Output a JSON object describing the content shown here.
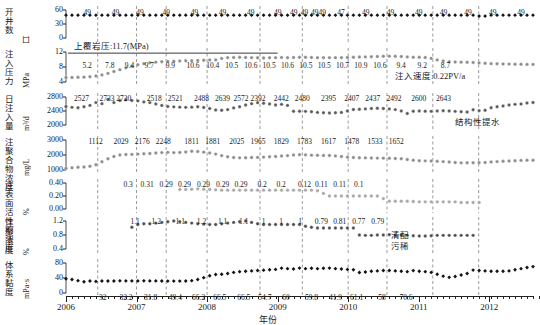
{
  "chart_data": {
    "type": "line",
    "title": "",
    "xlabel": "年份",
    "grid": "vertical dashed separators at year boundaries",
    "legend": "none",
    "x_range": [
      "2006",
      "2012.6"
    ],
    "x_ticks": [
      "2006",
      "2007",
      "2008",
      "2009",
      "2010",
      "2011",
      "2012"
    ],
    "annotations": [
      {
        "text": "上覆岩压:11.7(MPa)",
        "panel": "injection_pressure"
      },
      {
        "text": "注入速度:0.22PV/a",
        "panel": "injection_pressure"
      },
      {
        "text": "结构性提水",
        "panel": "daily_injection"
      },
      {
        "text": "清配",
        "panel": "polymer_concentration"
      },
      {
        "text": "污稀",
        "panel": "polymer_concentration"
      }
    ],
    "panels": [
      {
        "id": "open_wells",
        "ylabel": "开井数",
        "yunit": "口",
        "ylim": [
          0,
          60
        ],
        "yticks": [
          "0",
          "30",
          "60"
        ],
        "marker": "filled-diamond-black",
        "color": "#141414",
        "data_labels": [
          "49",
          "49",
          "49",
          "49",
          "49",
          "49",
          "49",
          "49",
          "49",
          "49",
          "4949",
          "47",
          "49",
          "49",
          "49",
          "49",
          "49",
          "49",
          "49"
        ],
        "values": [
          49,
          49,
          49,
          49,
          49,
          49,
          49,
          49,
          49,
          49,
          49,
          49,
          49,
          49,
          49,
          49,
          49,
          49,
          49,
          49,
          49,
          49,
          49,
          49,
          49,
          49,
          49,
          49,
          49,
          49,
          49,
          49,
          49,
          49,
          49,
          49,
          49,
          49,
          49,
          49,
          49,
          49,
          49,
          49,
          49,
          49,
          49,
          49,
          49,
          49,
          49,
          49,
          49,
          49,
          49,
          49,
          49,
          49,
          49,
          49,
          49,
          49,
          49,
          49,
          49,
          49,
          49,
          49,
          49,
          47,
          47,
          49,
          49,
          49,
          49,
          49,
          49,
          49,
          49
        ]
      },
      {
        "id": "injection_pressure",
        "ylabel": "注入压力",
        "yunit": "MPa",
        "ylim": [
          4,
          12
        ],
        "yticks": [
          "4",
          "8",
          "12"
        ],
        "marker": "circle-gray",
        "color": "#8c8c8c",
        "overburden_line": 11.7,
        "data_labels": [
          "5.2",
          "7.8",
          "9.4",
          "9.7",
          "9.9",
          "10.6",
          "10.4",
          "10.5",
          "10.6",
          "10.5",
          "10.6",
          "10.5",
          "10.5",
          "10.7",
          "10.9",
          "10.6",
          "9.4",
          "9.2",
          "8.7"
        ],
        "values": [
          5.2,
          5.2,
          5.25,
          5.3,
          5.4,
          5.6,
          5.9,
          6.3,
          6.8,
          7.3,
          7.8,
          8.2,
          8.6,
          8.9,
          9.15,
          9.3,
          9.4,
          9.5,
          9.55,
          9.6,
          9.65,
          9.7,
          9.75,
          9.8,
          9.85,
          9.9,
          10.3,
          10.5,
          10.55,
          10.6,
          10.55,
          10.5,
          10.45,
          10.4,
          10.45,
          10.5,
          10.55,
          10.5,
          10.55,
          10.6,
          10.6,
          10.55,
          10.5,
          10.5,
          10.5,
          10.5,
          10.5,
          10.55,
          10.6,
          10.65,
          10.7,
          10.75,
          10.8,
          10.85,
          10.9,
          10.85,
          10.8,
          10.7,
          10.6,
          10.6,
          10.55,
          10.3,
          9.9,
          9.6,
          9.4,
          9.35,
          9.3,
          9.25,
          9.2,
          9.1,
          9.0,
          8.9,
          8.85,
          8.8,
          8.78,
          8.75,
          8.72,
          8.7,
          8.7
        ]
      },
      {
        "id": "daily_injection",
        "ylabel": "日注入量",
        "yunit": "m³/d",
        "ylim": [
          2000,
          2800
        ],
        "yticks": [
          "2000",
          "2400",
          "2800"
        ],
        "marker": "circle-darkgray",
        "color": "#5a5a5a",
        "data_labels": [
          "2527",
          "2733",
          "2720",
          "2518",
          "2521",
          "2488",
          "2639",
          "2572",
          "2392",
          "2442",
          "2480",
          "2395",
          "2407",
          "2437",
          "2492",
          "2600",
          "2643"
        ],
        "values": [
          2527,
          2505,
          2495,
          2520,
          2560,
          2640,
          2610,
          2733,
          2640,
          2700,
          2720,
          2700,
          2690,
          2660,
          2640,
          2600,
          2560,
          2530,
          2518,
          2510,
          2505,
          2510,
          2521,
          2500,
          2470,
          2430,
          2420,
          2440,
          2488,
          2520,
          2570,
          2610,
          2639,
          2620,
          2600,
          2572,
          2590,
          2560,
          2392,
          2395,
          2390,
          2380,
          2360,
          2350,
          2345,
          2350,
          2360,
          2400,
          2442,
          2450,
          2460,
          2470,
          2480,
          2470,
          2460,
          2440,
          2400,
          2330,
          2395,
          2400,
          2395,
          2390,
          2400,
          2407,
          2400,
          2390,
          2380,
          2370,
          2437,
          2410,
          2420,
          2492,
          2520,
          2545,
          2570,
          2590,
          2600,
          2630,
          2643
        ]
      },
      {
        "id": "polymer_concentration",
        "ylabel": "注聚合物浓度",
        "yunit": "mg/L",
        "ylim": [
          1000,
          3000
        ],
        "yticks": [
          "1000",
          "2000",
          "3000"
        ],
        "marker": "circle-gray",
        "color": "#8c8c8c",
        "data_labels": [
          "1112",
          "2029",
          "2176",
          "2248",
          "1811",
          "1881",
          "2025",
          "1965",
          "1829",
          "1783",
          "1617",
          "1478",
          "1533",
          "1652"
        ],
        "values": [
          1112,
          1150,
          1180,
          1200,
          1250,
          1350,
          1550,
          1750,
          1900,
          2000,
          2029,
          2040,
          2060,
          2080,
          2100,
          2130,
          2160,
          2176,
          2160,
          2170,
          2200,
          2248,
          2230,
          2190,
          2140,
          2060,
          1960,
          1880,
          1830,
          1811,
          1820,
          1830,
          1840,
          1860,
          1881,
          1900,
          1930,
          1960,
          2000,
          2025,
          2010,
          1990,
          1980,
          1970,
          1965,
          1940,
          1900,
          1860,
          1829,
          1820,
          1810,
          1800,
          1795,
          1790,
          1783,
          1770,
          1750,
          1700,
          1650,
          1617,
          1610,
          1600,
          1580,
          1560,
          1530,
          1500,
          1478,
          1480,
          1485,
          1490,
          1500,
          1533,
          1560,
          1580,
          1600,
          1620,
          1640,
          1650,
          1652
        ]
      },
      {
        "id": "surfactant_concentration",
        "ylabel": "注表面活性剂浓度",
        "yunit": "%",
        "ylim": [
          0.0,
          0.4
        ],
        "yticks": [
          "0.00",
          "0.20",
          "0.40"
        ],
        "marker": "circle-lightgray",
        "color": "#a6a6a6",
        "data_labels": [
          "0.3",
          "0.31",
          "0.29",
          "0.29",
          "0.29",
          "0.29",
          "0.29",
          "0.2",
          "0.2",
          "0.12",
          "0.11",
          "0.11",
          "0.1"
        ],
        "values": [
          null,
          null,
          null,
          null,
          null,
          null,
          null,
          null,
          null,
          null,
          null,
          null,
          null,
          null,
          null,
          null,
          null,
          null,
          null,
          0.3,
          0.3,
          0.305,
          0.31,
          0.305,
          0.3,
          0.295,
          0.29,
          0.29,
          0.29,
          0.29,
          0.29,
          0.29,
          0.29,
          0.29,
          0.29,
          0.29,
          0.29,
          0.29,
          0.29,
          0.29,
          0.29,
          0.29,
          0.28,
          0.24,
          0.2,
          0.2,
          0.2,
          0.2,
          0.2,
          0.2,
          0.2,
          0.2,
          0.2,
          0.16,
          0.12,
          0.12,
          0.12,
          0.12,
          0.115,
          0.11,
          0.11,
          0.11,
          0.11,
          0.11,
          0.11,
          0.11,
          0.1,
          0.1,
          0.1,
          0.1,
          null,
          null,
          null,
          null,
          null,
          null,
          null,
          null,
          null,
          null
        ]
      },
      {
        "id": "polymer_dose",
        "ylabel": "注聚浓度",
        "yunit": "%",
        "ylim": [
          0.4,
          1.2
        ],
        "yticks": [
          "0.4",
          "0.8",
          "1.2"
        ],
        "marker": "circle-darkgray",
        "color": "#4d4d4d",
        "data_labels": [
          "1.1",
          "1.2",
          "1.1",
          "1.2",
          "1.1",
          "1.1",
          "1",
          "1",
          "1",
          "0.79",
          "0.81",
          "0.77",
          "0.79"
        ],
        "values": [
          null,
          null,
          null,
          null,
          null,
          null,
          null,
          null,
          null,
          null,
          null,
          1.02,
          1.1,
          1.12,
          1.12,
          1.14,
          1.16,
          1.18,
          1.2,
          1.18,
          1.16,
          1.14,
          1.12,
          1.11,
          1.1,
          1.1,
          1.12,
          1.14,
          1.16,
          1.18,
          1.2,
          1.16,
          1.12,
          1.1,
          1.1,
          1.1,
          1.1,
          1.1,
          1.1,
          1.1,
          1.05,
          1.02,
          1.0,
          1.0,
          1.0,
          1.0,
          1.0,
          1.0,
          1.0,
          0.8,
          0.79,
          0.79,
          0.8,
          0.8,
          0.81,
          0.8,
          0.8,
          0.79,
          0.78,
          0.77,
          0.77,
          0.78,
          0.79,
          0.79,
          0.79,
          0.79,
          0.79,
          0.79,
          0.79,
          null,
          null,
          null,
          null,
          null,
          null,
          null,
          null,
          null,
          null
        ]
      },
      {
        "id": "system_viscosity",
        "ylabel": "体系黏度",
        "yunit": "mPa·s",
        "ylim": [
          0,
          80
        ],
        "yticks": [
          "0",
          "40",
          "80"
        ],
        "marker": "filled-diamond-black",
        "color": "#141414",
        "data_labels": [
          "32",
          "32.2",
          "31.8",
          "49.4",
          "66.2",
          "66.5",
          "66.5",
          "54.7",
          "60",
          "59.8",
          "41.9",
          "61.1",
          "58",
          "70.6"
        ],
        "values": [
          38,
          36,
          33,
          30,
          32,
          31,
          32,
          32,
          32,
          32.5,
          32.2,
          32.3,
          32.2,
          32.4,
          32.3,
          32.2,
          32,
          31.9,
          31.8,
          31.8,
          32,
          33,
          36,
          41,
          46,
          49.4,
          50,
          52,
          55,
          57,
          58,
          59,
          60,
          61,
          62,
          63,
          66.2,
          65,
          64,
          66.5,
          65,
          66,
          65,
          66,
          66.5,
          65,
          64,
          63,
          62,
          54.7,
          56,
          58,
          59,
          60,
          60,
          59,
          58,
          57,
          59.8,
          58,
          57,
          55,
          50,
          45,
          41.9,
          44,
          48,
          52,
          61.1,
          60,
          59,
          58,
          58,
          58,
          59,
          62,
          65,
          68,
          70.6
        ]
      }
    ]
  }
}
